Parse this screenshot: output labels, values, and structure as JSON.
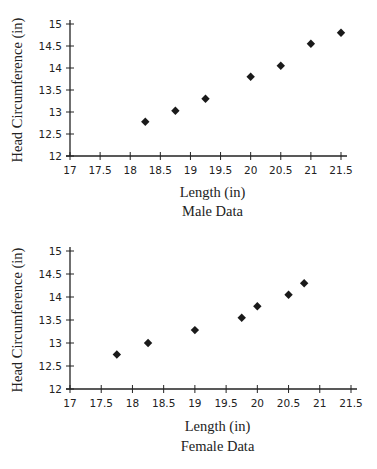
{
  "chart_data": [
    {
      "type": "scatter",
      "title": "Male Data",
      "xlabel": "Length (in)",
      "ylabel": "Head Circumference (in)",
      "xlim": [
        17,
        21.5
      ],
      "ylim": [
        12,
        15
      ],
      "xticks": [
        "17",
        "17.5",
        "18",
        "18.5",
        "19",
        "19.5",
        "20",
        "20.5",
        "21",
        "21.5"
      ],
      "yticks": [
        "12",
        "12.5",
        "13",
        "13.5",
        "14",
        "14.5",
        "15"
      ],
      "grid": false,
      "marker": "diamond",
      "series": [
        {
          "name": "Male",
          "x": [
            18.25,
            18.75,
            19.25,
            20,
            20.5,
            21,
            21.5
          ],
          "y": [
            12.78,
            13.03,
            13.3,
            13.8,
            14.05,
            14.55,
            14.8
          ]
        }
      ]
    },
    {
      "type": "scatter",
      "title": "Female Data",
      "xlabel": "Length (in)",
      "ylabel": "Head Circumference (in)",
      "xlim": [
        17,
        21.5
      ],
      "ylim": [
        12,
        15
      ],
      "xticks": [
        "17",
        "17.5",
        "18",
        "18.5",
        "19",
        "19.5",
        "20",
        "20.5",
        "21",
        "21.5"
      ],
      "yticks": [
        "12",
        "12.5",
        "13",
        "13.5",
        "14",
        "14.5",
        "15"
      ],
      "grid": false,
      "marker": "diamond",
      "series": [
        {
          "name": "Female",
          "x": [
            17.75,
            18.25,
            19,
            19.75,
            20,
            20.5,
            20.75
          ],
          "y": [
            12.75,
            13.0,
            13.28,
            13.55,
            13.8,
            14.05,
            14.3
          ]
        }
      ]
    }
  ],
  "colors": {
    "axis": "#222222",
    "marker": "#1a1a1a"
  }
}
